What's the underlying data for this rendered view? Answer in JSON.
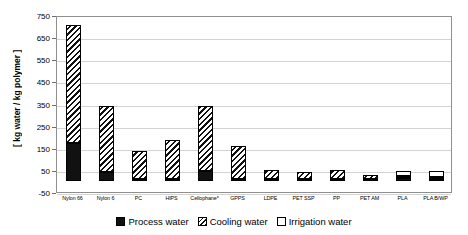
{
  "chart_data": {
    "type": "bar",
    "title": "",
    "subtitle": "",
    "xlabel": "",
    "ylabel": "[ kg water / kg polymer ]",
    "ylim": [
      -50,
      750
    ],
    "ytick_labels": [
      "750",
      "650",
      "550",
      "450",
      "350",
      "250",
      "150",
      "50",
      "-50"
    ],
    "ytick_values": [
      750,
      650,
      550,
      450,
      350,
      250,
      150,
      50,
      -50
    ],
    "grid": "horizontal",
    "stacked": true,
    "legend_position": "bottom-center",
    "categories": [
      "Nylon 66",
      "Nylon 6",
      "PC",
      "HIPS",
      "Cellophane*",
      "GPPS",
      "LDPE",
      "PET SSP",
      "PP",
      "PET AM",
      "PLA",
      "PLA B/WP"
    ],
    "series": [
      {
        "name": "Process water",
        "pattern": "solid-black",
        "color": "#111111",
        "values": [
          170,
          42,
          6,
          5,
          45,
          4,
          3,
          2,
          3,
          2,
          12,
          10
        ]
      },
      {
        "name": "Cooling water",
        "pattern": "diagonal-hatch",
        "color": "#111111",
        "values": [
          535,
          298,
          129,
          180,
          295,
          155,
          47,
          40,
          46,
          25,
          6,
          6
        ]
      },
      {
        "name": "Irrigation water",
        "pattern": "white-empty",
        "color": "#ffffff",
        "values": [
          0,
          0,
          0,
          0,
          0,
          0,
          0,
          0,
          0,
          0,
          26,
          28
        ]
      }
    ],
    "totals": [
      705,
      340,
      135,
      185,
      340,
      159,
      50,
      42,
      49,
      27,
      44,
      44
    ],
    "footnote": "*"
  },
  "legend": {
    "items": [
      {
        "label": "Process water",
        "swatch": "solid-black-swatch"
      },
      {
        "label": "Cooling water",
        "swatch": "hatched-swatch"
      },
      {
        "label": "Irrigation water",
        "swatch": "white-swatch"
      }
    ]
  }
}
